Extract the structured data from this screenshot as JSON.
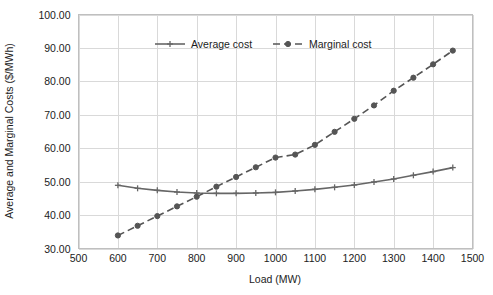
{
  "chart_data": {
    "type": "line",
    "title": "",
    "subtitle": "",
    "xlabel": "Load (MW)",
    "ylabel": "Average and Marginal Costs ($/MWh)",
    "xlim": [
      500,
      1500
    ],
    "ylim": [
      30,
      100
    ],
    "xticks": [
      500,
      600,
      700,
      800,
      900,
      1000,
      1100,
      1200,
      1300,
      1400,
      1500
    ],
    "xtick_labels": [
      "500",
      "600",
      "700",
      "800",
      "900",
      "1000",
      "1100",
      "1200",
      "1300",
      "1400",
      "1500"
    ],
    "yticks": [
      30,
      40,
      50,
      60,
      70,
      80,
      90,
      100
    ],
    "ytick_labels": [
      "30.00",
      "40.00",
      "50.00",
      "60.00",
      "70.00",
      "80.00",
      "90.00",
      "100.00"
    ],
    "grid": true,
    "legend_position": "top-center",
    "x": [
      600,
      650,
      700,
      750,
      800,
      850,
      900,
      950,
      1000,
      1050,
      1100,
      1150,
      1200,
      1250,
      1300,
      1350,
      1400,
      1450
    ],
    "series": [
      {
        "name": "Average cost",
        "color": "#666666",
        "line_style": "solid",
        "marker": "cross",
        "values": [
          48.9,
          48.0,
          47.4,
          46.9,
          46.6,
          46.5,
          46.5,
          46.6,
          46.8,
          47.2,
          47.7,
          48.3,
          49.0,
          49.9,
          50.8,
          51.9,
          53.0,
          54.2
        ]
      },
      {
        "name": "Marginal cost",
        "color": "#555555",
        "line_style": "dashed",
        "marker": "circle",
        "values": [
          33.9,
          36.8,
          39.7,
          42.6,
          45.5,
          48.5,
          51.4,
          54.3,
          57.2,
          58.1,
          61.0,
          64.9,
          68.8,
          72.8,
          77.2,
          81.1,
          85.1,
          89.2
        ]
      }
    ],
    "annotations": []
  },
  "legend": {
    "items": [
      {
        "label": "Average cost"
      },
      {
        "label": "Marginal cost"
      }
    ]
  },
  "colors": {
    "average_cost": "#666666",
    "marginal_cost": "#555555",
    "gridline": "#d9d9d9",
    "frame": "#bfbfbf",
    "text": "#1c1c1c",
    "background": "#ffffff"
  }
}
